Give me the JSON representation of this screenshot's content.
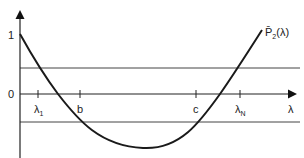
{
  "diagram": {
    "y_axis": {
      "labels": [
        "1",
        "0"
      ]
    },
    "x_axis": {
      "label": "λ"
    },
    "ticks": [
      {
        "name": "lambda-1",
        "base": "λ",
        "sub": "1"
      },
      {
        "name": "b",
        "base": "b",
        "sub": ""
      },
      {
        "name": "c",
        "base": "c",
        "sub": ""
      },
      {
        "name": "lambda-N",
        "base": "λ",
        "sub": "N"
      }
    ],
    "curve_label": {
      "base": "P̄",
      "sub": "2",
      "arg": "(λ)"
    },
    "horizontal_bands": [
      "upper-bound-line",
      "lower-bound-line"
    ]
  }
}
